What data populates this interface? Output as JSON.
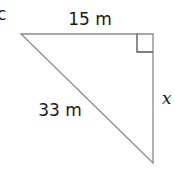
{
  "diagram": {
    "type": "right-triangle",
    "corner_label": "c",
    "sides": {
      "top": {
        "label": "15 m"
      },
      "hypotenuse": {
        "label": "33 m"
      },
      "right": {
        "label": "x"
      }
    },
    "colors": {
      "line": "#8a8a8a",
      "marker": "#555555",
      "text": "#1a1a1a"
    }
  }
}
